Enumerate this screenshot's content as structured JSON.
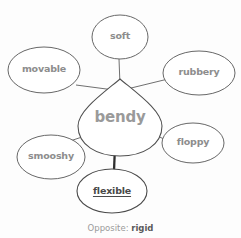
{
  "diagram": {
    "center": {
      "label": "bendy",
      "cx": 120,
      "cy": 117,
      "rx": 42,
      "ry": 38
    },
    "satellites": [
      {
        "id": "soft",
        "label": "soft",
        "cx": 120,
        "cy": 37,
        "rx": 28,
        "ry": 22,
        "emphasis": "none"
      },
      {
        "id": "movable",
        "label": "movable",
        "cx": 44,
        "cy": 70,
        "rx": 36,
        "ry": 23,
        "emphasis": "none"
      },
      {
        "id": "rubbery",
        "label": "rubbery",
        "cx": 199,
        "cy": 73,
        "rx": 36,
        "ry": 22,
        "emphasis": "none"
      },
      {
        "id": "floppy",
        "label": "floppy",
        "cx": 193,
        "cy": 143,
        "rx": 31,
        "ry": 20,
        "emphasis": "none"
      },
      {
        "id": "smooshy",
        "label": "smooshy",
        "cx": 51,
        "cy": 157,
        "rx": 34,
        "ry": 22,
        "emphasis": "none"
      },
      {
        "id": "flexible",
        "label": "flexible",
        "cx": 112,
        "cy": 191,
        "rx": 35,
        "ry": 22,
        "emphasis": "bold-underline"
      }
    ],
    "connectors": [
      {
        "from": "bendy",
        "to": "soft",
        "x1": 120,
        "y1": 85,
        "x2": 119,
        "y2": 59,
        "weight": "thin"
      },
      {
        "from": "bendy",
        "to": "movable",
        "x1": 112,
        "y1": 87,
        "x2": 76,
        "y2": 85,
        "weight": "thin"
      },
      {
        "from": "bendy",
        "to": "rubbery",
        "x1": 132,
        "y1": 90,
        "x2": 167,
        "y2": 78,
        "weight": "thin"
      },
      {
        "from": "bendy",
        "to": "floppy",
        "x1": 146,
        "y1": 130,
        "x2": 167,
        "y2": 140,
        "weight": "thin"
      },
      {
        "from": "bendy",
        "to": "smooshy",
        "x1": 91,
        "y1": 134,
        "x2": 70,
        "y2": 141,
        "weight": "thin"
      },
      {
        "from": "bendy",
        "to": "flexible",
        "x1": 115,
        "y1": 146,
        "x2": 114,
        "y2": 171,
        "weight": "thick"
      }
    ],
    "caption": {
      "prefix": "Opposite:",
      "word": "rigid"
    },
    "colors": {
      "stroke": "#5f5f5f",
      "text": "#8d8d8d",
      "emphasis_text": "#4a4a4a",
      "background": "#fdfdfd"
    }
  }
}
